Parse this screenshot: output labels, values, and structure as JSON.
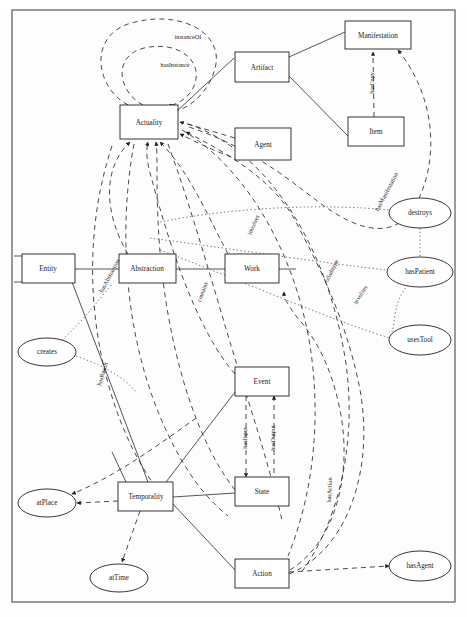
{
  "diagram": {
    "kind": "ontology-concept-graph",
    "frame": {
      "x": 12,
      "y": 10,
      "width": 443,
      "height": 592
    },
    "colors": {
      "background": "#fdfdfd",
      "stroke": "#1f1f1f",
      "edge": "#2b2b2b",
      "dotted_edge": "#555555",
      "text": "#1a1a1a",
      "frame": "#4a4a4a"
    },
    "nodes": [
      {
        "id": "actuality",
        "label": "Actuality",
        "shape": "box",
        "x": 120,
        "y": 105,
        "width": 58,
        "height": 34
      },
      {
        "id": "artifact",
        "label": "Artifact",
        "shape": "box",
        "x": 235,
        "y": 52,
        "width": 54,
        "height": 30
      },
      {
        "id": "manifestation",
        "label": "Manifestation",
        "shape": "box",
        "x": 345,
        "y": 21,
        "width": 66,
        "height": 28
      },
      {
        "id": "item",
        "label": "Item",
        "shape": "box",
        "x": 348,
        "y": 117,
        "width": 56,
        "height": 29
      },
      {
        "id": "agent",
        "label": "Agent",
        "shape": "box",
        "x": 235,
        "y": 128,
        "width": 56,
        "height": 32
      },
      {
        "id": "entity",
        "label": "Entity",
        "shape": "box",
        "x": 22,
        "y": 254,
        "width": 53,
        "height": 29
      },
      {
        "id": "abstraction",
        "label": "Abstraction",
        "shape": "box",
        "x": 119,
        "y": 254,
        "width": 57,
        "height": 29
      },
      {
        "id": "work",
        "label": "Work",
        "shape": "box",
        "x": 225,
        "y": 254,
        "width": 54,
        "height": 29
      },
      {
        "id": "event",
        "label": "Event",
        "shape": "box",
        "x": 235,
        "y": 367,
        "width": 54,
        "height": 29
      },
      {
        "id": "state",
        "label": "State",
        "shape": "box",
        "x": 235,
        "y": 477,
        "width": 54,
        "height": 29
      },
      {
        "id": "action",
        "label": "Action",
        "shape": "box",
        "x": 235,
        "y": 559,
        "width": 54,
        "height": 29
      },
      {
        "id": "temporality",
        "label": "Temporality",
        "shape": "box",
        "x": 118,
        "y": 482,
        "width": 55,
        "height": 29
      },
      {
        "id": "destroys",
        "label": "destroys",
        "shape": "ellipse",
        "cx": 420,
        "cy": 213,
        "rx": 31,
        "ry": 15
      },
      {
        "id": "haspatient",
        "label": "hasPatient",
        "shape": "ellipse",
        "cx": 420,
        "cy": 272,
        "rx": 33,
        "ry": 15
      },
      {
        "id": "usestool",
        "label": "usesTool",
        "shape": "ellipse",
        "cx": 420,
        "cy": 340,
        "rx": 31,
        "ry": 15
      },
      {
        "id": "creates",
        "label": "creates",
        "shape": "ellipse",
        "cx": 47,
        "cy": 352,
        "rx": 29,
        "ry": 14
      },
      {
        "id": "atplace",
        "label": "atPlace",
        "shape": "ellipse",
        "cx": 47,
        "cy": 503,
        "rx": 29,
        "ry": 14
      },
      {
        "id": "attime",
        "label": "atTime",
        "shape": "ellipse",
        "cx": 119,
        "cy": 578,
        "rx": 29,
        "ry": 14
      },
      {
        "id": "hasagent",
        "label": "hasAgent",
        "shape": "ellipse",
        "cx": 420,
        "cy": 566,
        "rx": 31,
        "ry": 15
      }
    ],
    "edge_labels": [
      {
        "id": "instanceof",
        "text": "instanceOf",
        "x": 188,
        "y": 38,
        "rotate": 0
      },
      {
        "id": "hasinstance",
        "text": "hasInstance",
        "x": 175,
        "y": 66,
        "rotate": 0
      },
      {
        "id": "hascopy",
        "text": "hasCopy",
        "x": 373,
        "y": 83,
        "rotate": -90
      },
      {
        "id": "hasmanifestation",
        "text": "hasManifestation",
        "x": 387,
        "y": 192,
        "rotate": -62
      },
      {
        "id": "involves",
        "text": "involves",
        "x": 254,
        "y": 225,
        "rotate": -66
      },
      {
        "id": "issubtype",
        "text": "isSubtype",
        "x": 332,
        "y": 271,
        "rotate": -64
      },
      {
        "id": "involves2",
        "text": "involves",
        "x": 361,
        "y": 295,
        "rotate": -58
      },
      {
        "id": "hasabstraction",
        "text": "hasAbstraction",
        "x": 110,
        "y": 276,
        "rotate": -62
      },
      {
        "id": "contains",
        "text": "contains",
        "x": 203,
        "y": 292,
        "rotate": -70
      },
      {
        "id": "hasresult",
        "text": "hasResult",
        "x": 103,
        "y": 374,
        "rotate": -72
      },
      {
        "id": "hasinput",
        "text": "hasInput",
        "x": 246,
        "y": 438,
        "rotate": -90
      },
      {
        "id": "hasoutput",
        "text": "hasOutput",
        "x": 274,
        "y": 438,
        "rotate": -90
      },
      {
        "id": "hasaction",
        "text": "hasAction",
        "x": 330,
        "y": 490,
        "rotate": -88
      }
    ],
    "relations": [
      {
        "from": "actuality",
        "to": "actuality",
        "label": "instanceOf",
        "style": "dashed"
      },
      {
        "from": "actuality",
        "to": "actuality",
        "label": "hasInstance",
        "style": "dashed"
      },
      {
        "from": "artifact",
        "to": "manifestation",
        "label": "",
        "style": "solid"
      },
      {
        "from": "artifact",
        "to": "item",
        "label": "",
        "style": "solid"
      },
      {
        "from": "artifact",
        "to": "actuality",
        "label": "",
        "style": "solid"
      },
      {
        "from": "item",
        "to": "manifestation",
        "label": "hasCopy",
        "style": "dashed"
      },
      {
        "from": "manifestation",
        "to": "actuality",
        "label": "hasManifestation",
        "style": "dashed"
      },
      {
        "from": "agent",
        "to": "actuality",
        "label": "",
        "style": "dashed"
      },
      {
        "from": "entity",
        "to": "abstraction",
        "label": "",
        "style": "solid"
      },
      {
        "from": "abstraction",
        "to": "work",
        "label": "",
        "style": "solid"
      },
      {
        "from": "abstraction",
        "to": "actuality",
        "label": "hasAbstraction",
        "style": "dashed"
      },
      {
        "from": "work",
        "to": "actuality",
        "label": "contains",
        "style": "dashed"
      },
      {
        "from": "work",
        "to": "destroys",
        "label": "involves",
        "style": "dotted"
      },
      {
        "from": "work",
        "to": "haspatient",
        "label": "isSubtype",
        "style": "dotted"
      },
      {
        "from": "work",
        "to": "usestool",
        "label": "involves",
        "style": "dotted"
      },
      {
        "from": "destroys",
        "to": "haspatient",
        "label": "",
        "style": "dotted"
      },
      {
        "from": "haspatient",
        "to": "usestool",
        "label": "",
        "style": "dotted"
      },
      {
        "from": "creates",
        "to": "entity",
        "label": "",
        "style": "dotted"
      },
      {
        "from": "creates",
        "to": "temporality",
        "label": "hasResult",
        "style": "dotted"
      },
      {
        "from": "event",
        "to": "state",
        "label": "hasInput",
        "style": "dashed"
      },
      {
        "from": "state",
        "to": "event",
        "label": "hasOutput",
        "style": "dashed"
      },
      {
        "from": "event",
        "to": "actuality",
        "label": "",
        "style": "dashed"
      },
      {
        "from": "state",
        "to": "actuality",
        "label": "hasAction",
        "style": "dashed"
      },
      {
        "from": "action",
        "to": "hasagent",
        "label": "",
        "style": "dashed"
      },
      {
        "from": "action",
        "to": "actuality",
        "label": "",
        "style": "dashed"
      },
      {
        "from": "temporality",
        "to": "atplace",
        "label": "",
        "style": "dashed"
      },
      {
        "from": "temporality",
        "to": "attime",
        "label": "",
        "style": "dashed"
      },
      {
        "from": "temporality",
        "to": "action",
        "label": "",
        "style": "solid"
      },
      {
        "from": "entity",
        "to": "temporality",
        "label": "",
        "style": "solid"
      }
    ]
  }
}
